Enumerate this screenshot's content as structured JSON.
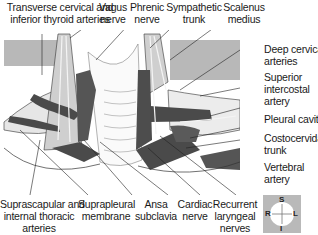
{
  "figure": {
    "type": "anatomical illustration",
    "colors": {
      "background": "#ffffff",
      "panel_gray": "#b8b8b8",
      "vessel_dark": "#4a4a4a",
      "muscle_light": "#d9d9d9",
      "outline": "#333333"
    }
  },
  "labels_top": [
    {
      "lines": [
        "Transverse cervical and",
        "inferior thyroid arteries"
      ]
    },
    {
      "lines": [
        "Vagus",
        "nerve"
      ]
    },
    {
      "lines": [
        "Phrenic",
        "nerve"
      ]
    },
    {
      "lines": [
        "Sympathetic",
        "trunk"
      ]
    },
    {
      "lines": [
        "Scalenus",
        "medius"
      ]
    }
  ],
  "labels_right": [
    {
      "lines": [
        "Deep cervical",
        "arteries"
      ]
    },
    {
      "lines": [
        "Superior",
        "intercostal",
        "artery"
      ]
    },
    {
      "lines": [
        "Pleural cavity"
      ]
    },
    {
      "lines": [
        "Costocervida",
        "trunk"
      ]
    },
    {
      "lines": [
        "Vertebral",
        "artery"
      ]
    }
  ],
  "labels_bottom": [
    {
      "lines": [
        "Suprascapular and",
        "internal thoracic",
        "arteries"
      ]
    },
    {
      "lines": [
        "Suprapleural",
        "membrane"
      ]
    },
    {
      "lines": [
        "Ansa",
        "subclavia"
      ]
    },
    {
      "lines": [
        "Cardiac",
        "nerve"
      ]
    },
    {
      "lines": [
        "Recurrent",
        "laryngeal",
        "nerves"
      ]
    }
  ],
  "compass": {
    "top": "S",
    "bottom": "I",
    "left": "R",
    "right": "L"
  }
}
